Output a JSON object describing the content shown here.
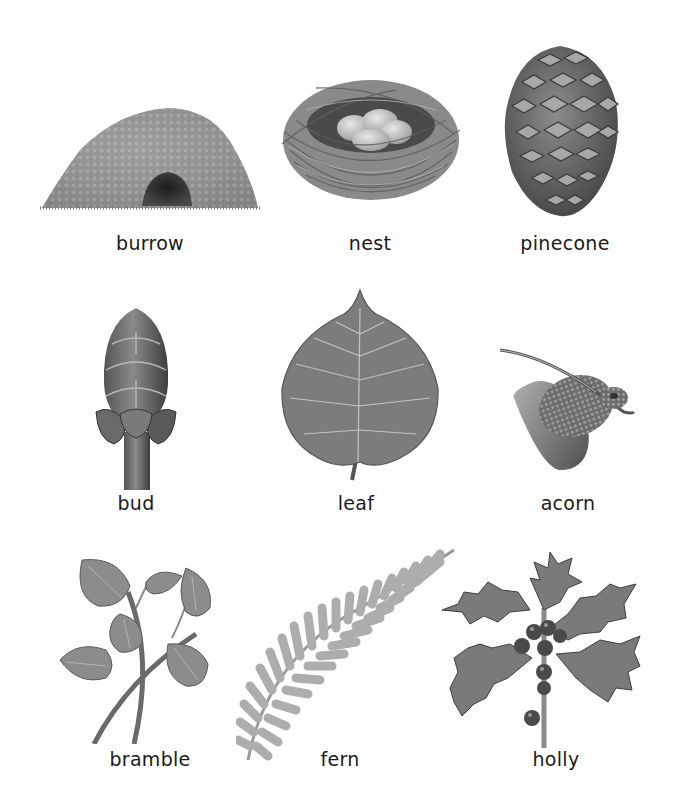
{
  "items": [
    {
      "label": "burrow",
      "icon": "burrow-icon"
    },
    {
      "label": "nest",
      "icon": "nest-icon"
    },
    {
      "label": "pinecone",
      "icon": "pinecone-icon"
    },
    {
      "label": "bud",
      "icon": "bud-icon"
    },
    {
      "label": "leaf",
      "icon": "leaf-icon"
    },
    {
      "label": "acorn",
      "icon": "acorn-icon"
    },
    {
      "label": "bramble",
      "icon": "bramble-icon"
    },
    {
      "label": "fern",
      "icon": "fern-icon"
    },
    {
      "label": "holly",
      "icon": "holly-icon"
    }
  ],
  "colors": {
    "background": "#ffffff",
    "text": "#1a1a1a",
    "illustration_dark": "#3c3c3c",
    "illustration_mid": "#7a7a7a",
    "illustration_light": "#bdbdbd"
  }
}
